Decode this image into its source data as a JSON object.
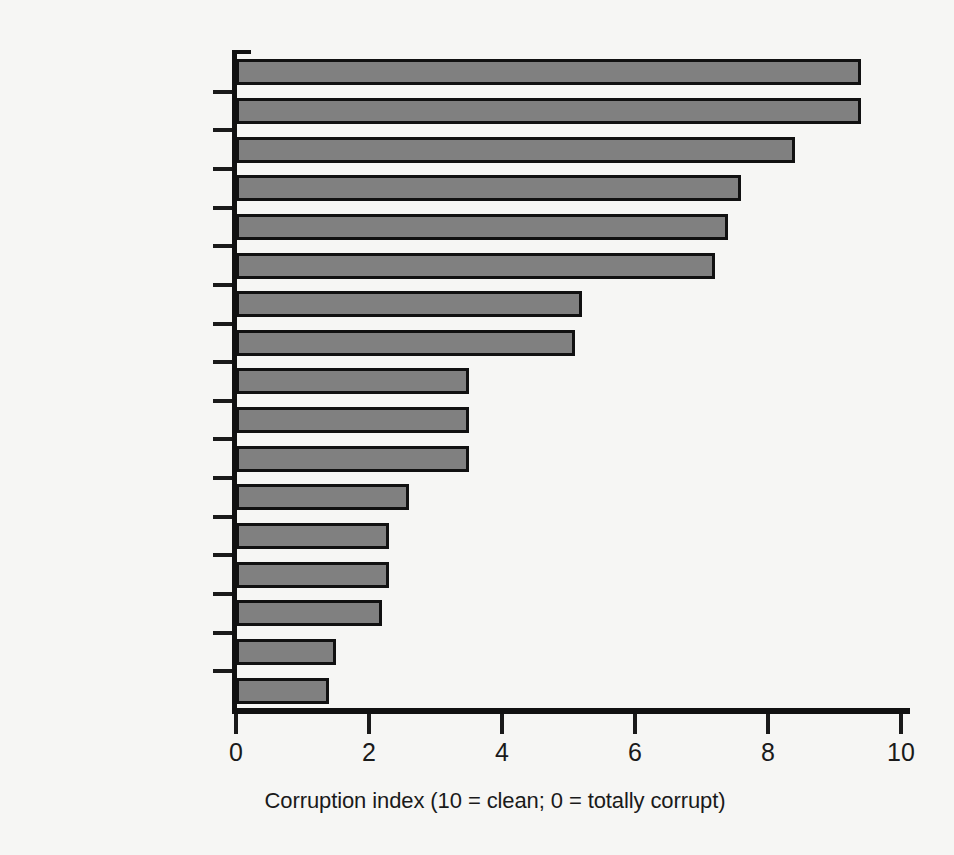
{
  "chart_data": {
    "type": "bar",
    "orientation": "horizontal",
    "title": "",
    "subtitle": "",
    "xlabel": "Corruption index (10 = clean; 0 = totally corrupt)",
    "ylabel": "",
    "xlim": [
      0,
      10
    ],
    "xticks": [
      0,
      2,
      4,
      6,
      8,
      10
    ],
    "xticklabels": [
      "0",
      "2",
      "4",
      "6",
      "8",
      "10"
    ],
    "grid": false,
    "legend": null,
    "bar_color": "#808080",
    "bar_edge_color": "#111111",
    "background_color": "#f6f6f4",
    "categories": [
      "Finland",
      "New Zealand",
      "United Kingdom",
      "Japan",
      "France",
      "United States",
      "Italy",
      "South Korea",
      "Brazil",
      "China",
      "India",
      "Vietnam",
      "Russia",
      "Indonesia",
      "Nigeria",
      "Iraq",
      "Somalia"
    ],
    "values": [
      9.4,
      9.4,
      8.4,
      7.6,
      7.4,
      7.2,
      5.2,
      5.1,
      3.5,
      3.5,
      3.5,
      2.6,
      2.3,
      2.3,
      2.2,
      1.5,
      1.4
    ],
    "series": [
      {
        "name": "Corruption index",
        "values": [
          9.4,
          9.4,
          8.4,
          7.6,
          7.4,
          7.2,
          5.2,
          5.1,
          3.5,
          3.5,
          3.5,
          2.6,
          2.3,
          2.3,
          2.2,
          1.5,
          1.4
        ]
      }
    ]
  }
}
